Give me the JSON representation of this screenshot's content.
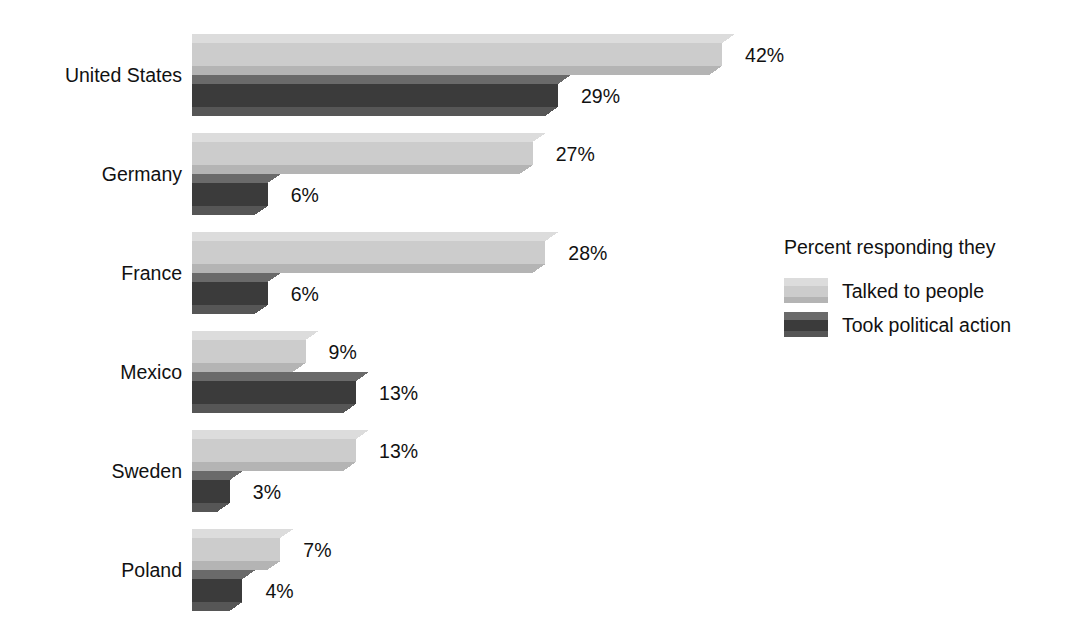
{
  "chart_data": {
    "type": "bar",
    "orientation": "horizontal",
    "title": "",
    "subtitle": "",
    "xlabel": "",
    "ylabel": "",
    "categories": [
      "United States",
      "Germany",
      "France",
      "Mexico",
      "Sweden",
      "Poland"
    ],
    "series": [
      {
        "name": "Talked to people",
        "color": "#d0d0d0",
        "values": [
          42,
          27,
          28,
          9,
          13,
          7
        ],
        "value_labels": [
          "42%",
          "27%",
          "28%",
          "9%",
          "13%",
          "7%"
        ]
      },
      {
        "name": "Took political action",
        "color": "#5a5a5a",
        "values": [
          29,
          6,
          6,
          13,
          3,
          4
        ],
        "value_labels": [
          "29%",
          "6%",
          "6%",
          "13%",
          "3%",
          "4%"
        ]
      }
    ],
    "xlim": [
      0,
      42
    ],
    "grid": false,
    "axis_visible": false,
    "legend": {
      "position": "right",
      "title": "Percent responding they",
      "entries": [
        {
          "label": "Talked to people",
          "color": "#d0d0d0"
        },
        {
          "label": "Took political action",
          "color": "#5a5a5a"
        }
      ]
    },
    "style": {
      "effect": "3d-bevel",
      "background": "#ffffff",
      "text_color": "#111111"
    }
  },
  "palette": {
    "light_top": "#dcdcdc",
    "light_front": "#cccccc",
    "light_side": "#bdbdbd",
    "light_bottom": "#b4b4b4",
    "dark_top": "#6a6a6a",
    "dark_front": "#3b3b3b",
    "dark_side": "#2e2e2e",
    "dark_bottom": "#565656",
    "background": "#ffffff",
    "text": "#111111"
  }
}
